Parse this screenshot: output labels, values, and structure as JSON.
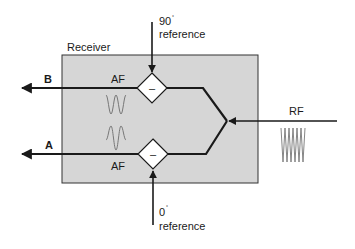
{
  "diagram": {
    "receiver": {
      "label": "Receiver",
      "fill": "#d6d6d6",
      "stroke": "#333333"
    },
    "inputs": {
      "rf": {
        "label": "RF"
      },
      "ref_90": {
        "value": "90",
        "degree": "°",
        "label": "reference"
      },
      "ref_0": {
        "value": "0",
        "degree": "°",
        "label": "reference"
      }
    },
    "mixers": [
      {
        "id": "mixer-top",
        "symbol": "–"
      },
      {
        "id": "mixer-bottom",
        "symbol": "–"
      }
    ],
    "outputs": {
      "b": {
        "label": "B",
        "af_label": "AF"
      },
      "a": {
        "label": "A",
        "af_label": "AF"
      }
    },
    "colors": {
      "line": "#1a1a1a",
      "waveform": "#777777",
      "box_fill": "#d6d6d6"
    }
  }
}
